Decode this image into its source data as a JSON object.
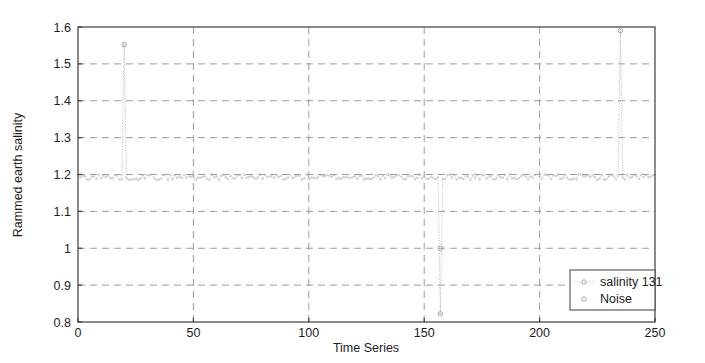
{
  "chart_data": {
    "type": "line",
    "title": "",
    "xlabel": "Time Series",
    "ylabel": "Rammed earth salinity",
    "xlim": [
      0,
      250
    ],
    "ylim": [
      0.8,
      1.6
    ],
    "xticks": [
      0,
      50,
      100,
      150,
      200,
      250
    ],
    "yticks": [
      0.8,
      0.9,
      1,
      1.1,
      1.2,
      1.3,
      1.4,
      1.5,
      1.6
    ],
    "xtick_labels": [
      "0",
      "50",
      "100",
      "150",
      "200",
      "250"
    ],
    "ytick_labels": [
      "0.8",
      "0.9",
      "1",
      "1.1",
      "1.2",
      "1.3",
      "1.4",
      "1.5",
      "1.6"
    ],
    "grid": true,
    "grid_style": "dashed",
    "grid_color": "#9a9a9a",
    "legend_position": "bottom-right",
    "legend": [
      {
        "name": "salinity 131",
        "style": "dotted-line-with-circle-marker",
        "color": "#b9b9b9"
      },
      {
        "name": "Noise",
        "style": "circle-marker",
        "color": "#b9b9b9"
      }
    ],
    "series": [
      {
        "name": "salinity 131",
        "style": "dotted",
        "color": "#b9b9b9",
        "baseline": 1.193,
        "baseline_noise_amplitude": 0.008,
        "description": "Dense noisy flat signal near 1.19 with three large outlier spikes",
        "spikes": [
          {
            "x": 20,
            "y": 1.552,
            "direction": "up"
          },
          {
            "x": 157,
            "y": 0.822,
            "direction": "down"
          },
          {
            "x": 235,
            "y": 1.59,
            "direction": "up"
          }
        ]
      },
      {
        "name": "Noise",
        "style": "markers",
        "color": "#b9b9b9",
        "points": [
          {
            "x": 20,
            "y": 1.552
          },
          {
            "x": 157,
            "y": 1.0
          },
          {
            "x": 157,
            "y": 0.822
          },
          {
            "x": 235,
            "y": 1.59
          }
        ]
      }
    ]
  },
  "axes": {
    "x_title": "Time Series",
    "y_title": "Rammed earth salinity"
  },
  "legend": {
    "item1": "salinity 131",
    "item2": "Noise"
  },
  "colors": {
    "axis": "#3c3c3c",
    "grid": "#9a9a9a",
    "series": "#bdbdbd",
    "text": "#1c1c1c"
  }
}
